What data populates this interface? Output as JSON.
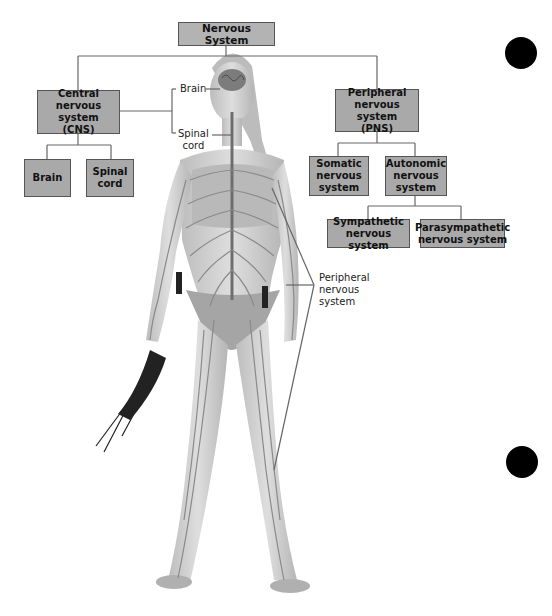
{
  "diagram": {
    "title": "Nervous System",
    "branches": {
      "cns": {
        "label": "Central\nnervous system\n(CNS)",
        "children": [
          {
            "label": "Brain"
          },
          {
            "label": "Spinal\ncord"
          }
        ]
      },
      "pns": {
        "label": "Peripheral\nnervous system\n(PNS)",
        "children": [
          {
            "label": "Somatic\nnervous\nsystem"
          },
          {
            "label": "Autonomic\nnervous\nsystem",
            "children": [
              {
                "label": "Sympathetic\nnervous system"
              },
              {
                "label": "Parasympathetic\nnervous system"
              }
            ]
          }
        ]
      }
    },
    "callouts": {
      "brain": "Brain",
      "spinal_cord": "Spinal\ncord",
      "peripheral": "Peripheral\nnervous\nsystem"
    },
    "figure": {
      "subject": "human-body-nervous-system-illustration",
      "holding": "running-shoes"
    },
    "colors": {
      "box_fill": "#a9a9a9",
      "box_border": "#555555",
      "connector": "#666666",
      "nerve": "#8a8a8a",
      "skin": "#cfcfcf",
      "marker": "#000000"
    }
  }
}
